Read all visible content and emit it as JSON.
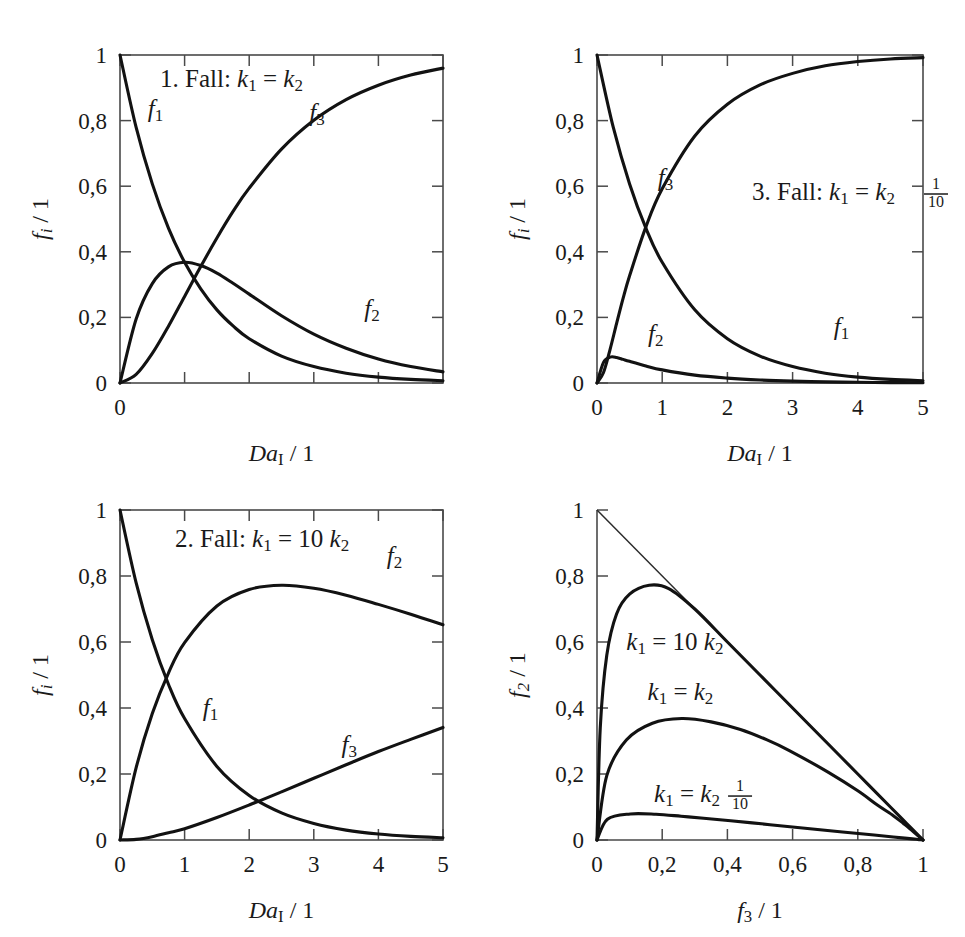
{
  "figure": {
    "background": "#ffffff",
    "curve_color": "#121212",
    "axis_color": "#4a4a4a",
    "panel_count": 4
  },
  "labels": {
    "f1": "f₁",
    "f2": "f₂",
    "f3": "f₃",
    "k1": "k₁",
    "k2": "k₂",
    "DaI_axis": "Daᴵ / 1",
    "fi_axis": "fᵢ / 1",
    "f2_axis": "f₂ / 1",
    "f3_axis": "f₃ / 1"
  },
  "chart_data": [
    {
      "id": "panel-1-fall-1",
      "type": "line",
      "title": "1. Fall: k₁ = k₂",
      "title_parts": {
        "prefix": "1. Fall: ",
        "lhs": "k",
        "lhs_sub": "1",
        "rel": "=",
        "coef": "",
        "rhs": "k",
        "rhs_sub": "2"
      },
      "xlabel": "Daᴵ / 1",
      "ylabel": "fᵢ / 1",
      "xlim": [
        0,
        5
      ],
      "ylim": [
        0,
        1
      ],
      "xticks": [
        0,
        1,
        2,
        3,
        4,
        5
      ],
      "xticklabels": [
        "0",
        "",
        "",
        "",
        "",
        ""
      ],
      "yticks": [
        0,
        0.2,
        0.4,
        0.6,
        0.8,
        1
      ],
      "yticklabels": [
        "0",
        "0,2",
        "0,4",
        "0,6",
        "0,8",
        "1"
      ],
      "grid": false,
      "frame": "box",
      "legend": "inline-curve-labels",
      "annotations": [
        {
          "text": "f₁",
          "x": 0.55,
          "y": 0.81
        },
        {
          "text": "f₃",
          "x": 3.05,
          "y": 0.8
        },
        {
          "text": "f₂",
          "x": 3.9,
          "y": 0.2
        }
      ],
      "series": [
        {
          "name": "f1",
          "formula": "exp(-Da)",
          "x": [
            0,
            0.25,
            0.5,
            0.75,
            1,
            1.25,
            1.5,
            1.75,
            2,
            2.5,
            3,
            3.5,
            4,
            4.5,
            5
          ],
          "values": [
            1,
            0.779,
            0.607,
            0.472,
            0.368,
            0.287,
            0.223,
            0.174,
            0.135,
            0.082,
            0.05,
            0.03,
            0.018,
            0.011,
            0.007
          ]
        },
        {
          "name": "f2",
          "formula": "Da*exp(-Da)",
          "x": [
            0,
            0.25,
            0.5,
            0.75,
            1,
            1.25,
            1.5,
            1.75,
            2,
            2.5,
            3,
            3.5,
            4,
            4.5,
            5
          ],
          "values": [
            0,
            0.195,
            0.303,
            0.354,
            0.368,
            0.358,
            0.335,
            0.304,
            0.271,
            0.205,
            0.149,
            0.106,
            0.073,
            0.05,
            0.034
          ]
        },
        {
          "name": "f3",
          "formula": "1-(1+Da)exp(-Da)",
          "x": [
            0,
            0.25,
            0.5,
            0.75,
            1,
            1.25,
            1.5,
            1.75,
            2,
            2.5,
            3,
            3.5,
            4,
            4.5,
            5
          ],
          "values": [
            0,
            0.026,
            0.09,
            0.173,
            0.264,
            0.355,
            0.442,
            0.523,
            0.594,
            0.713,
            0.801,
            0.864,
            0.908,
            0.939,
            0.96
          ]
        }
      ]
    },
    {
      "id": "panel-3-fall-3",
      "type": "line",
      "title": "3. Fall: k₁ = 1/10 k₂",
      "title_parts": {
        "prefix": "3. Fall: ",
        "lhs": "k",
        "lhs_sub": "1",
        "rel": "=",
        "coef_num": "1",
        "coef_den": "10",
        "rhs": "k",
        "rhs_sub": "2"
      },
      "xlabel": "Daᴵ / 1",
      "ylabel": "fᵢ / 1",
      "xlim": [
        0,
        5
      ],
      "ylim": [
        0,
        1
      ],
      "xticks": [
        0,
        1,
        2,
        3,
        4,
        5
      ],
      "xticklabels": [
        "0",
        "1",
        "2",
        "3",
        "4",
        "5"
      ],
      "yticks": [
        0,
        0.2,
        0.4,
        0.6,
        0.8,
        1
      ],
      "yticklabels": [
        "0",
        "0,2",
        "0,4",
        "0,6",
        "0,8",
        "1"
      ],
      "grid": false,
      "frame": "box",
      "legend": "inline-curve-labels",
      "annotations": [
        {
          "text": "f₃",
          "x": 1.05,
          "y": 0.6
        },
        {
          "text": "f₂",
          "x": 0.9,
          "y": 0.125
        },
        {
          "text": "f₁",
          "x": 3.75,
          "y": 0.145
        }
      ],
      "series": [
        {
          "name": "f1",
          "formula": "exp(-Da)",
          "x": [
            0,
            0.25,
            0.5,
            0.75,
            1,
            1.5,
            2,
            2.5,
            3,
            3.5,
            4,
            4.5,
            5
          ],
          "values": [
            1,
            0.779,
            0.607,
            0.472,
            0.368,
            0.223,
            0.135,
            0.082,
            0.05,
            0.03,
            0.018,
            0.011,
            0.007
          ]
        },
        {
          "name": "f2",
          "formula": "(k1/(k2-k1))*(exp(-k1 Da)-exp(-k2 Da)), k2=10k1",
          "x": [
            0,
            0.1,
            0.2,
            0.3,
            0.4,
            0.5,
            0.75,
            1,
            1.5,
            2,
            2.5,
            3,
            3.5,
            4,
            4.5,
            5
          ],
          "values": [
            0,
            0.063,
            0.079,
            0.078,
            0.072,
            0.066,
            0.052,
            0.04,
            0.024,
            0.015,
            0.0092,
            0.0056,
            0.0034,
            0.0021,
            0.0012,
            0.0008
          ]
        },
        {
          "name": "f3",
          "formula": "1-f1-f2",
          "x": [
            0,
            0.1,
            0.2,
            0.3,
            0.4,
            0.5,
            0.75,
            1,
            1.5,
            2,
            2.5,
            3,
            3.5,
            4,
            4.5,
            5
          ],
          "values": [
            0,
            0.032,
            0.102,
            0.181,
            0.258,
            0.327,
            0.476,
            0.592,
            0.753,
            0.85,
            0.909,
            0.944,
            0.967,
            0.98,
            0.988,
            0.992
          ]
        }
      ]
    },
    {
      "id": "panel-2-fall-2",
      "type": "line",
      "title": "2. Fall: k₁ = 10 k₂",
      "title_parts": {
        "prefix": "2. Fall: ",
        "lhs": "k",
        "lhs_sub": "1",
        "rel": "=",
        "coef": "10",
        "rhs": "k",
        "rhs_sub": "2"
      },
      "xlabel": "Daᴵ / 1",
      "ylabel": "fᵢ / 1",
      "xlim": [
        0,
        5
      ],
      "ylim": [
        0,
        1
      ],
      "xticks": [
        0,
        1,
        2,
        3,
        4,
        5
      ],
      "xticklabels": [
        "0",
        "1",
        "2",
        "3",
        "4",
        "5"
      ],
      "yticks": [
        0,
        0.2,
        0.4,
        0.6,
        0.8,
        1
      ],
      "yticklabels": [
        "0",
        "0,2",
        "0,4",
        "0,6",
        "0,8",
        "1"
      ],
      "grid": false,
      "frame": "box",
      "legend": "inline-curve-labels",
      "annotations": [
        {
          "text": "f₂",
          "x": 4.25,
          "y": 0.835
        },
        {
          "text": "f₁",
          "x": 1.4,
          "y": 0.375
        },
        {
          "text": "f₃",
          "x": 3.55,
          "y": 0.265
        }
      ],
      "series": [
        {
          "name": "f1",
          "formula": "exp(-Da)",
          "x": [
            0,
            0.25,
            0.5,
            0.75,
            1,
            1.5,
            2,
            2.5,
            3,
            3.5,
            4,
            4.5,
            5
          ],
          "values": [
            1,
            0.779,
            0.607,
            0.472,
            0.368,
            0.223,
            0.135,
            0.082,
            0.05,
            0.03,
            0.018,
            0.011,
            0.007
          ]
        },
        {
          "name": "f2",
          "formula": "(10/9)*(exp(-0.1 Da)-exp(-Da))",
          "x": [
            0,
            0.25,
            0.5,
            0.75,
            1,
            1.5,
            2,
            2.5,
            3,
            3.5,
            4,
            4.5,
            5
          ],
          "values": [
            0,
            0.219,
            0.383,
            0.506,
            0.598,
            0.709,
            0.759,
            0.772,
            0.763,
            0.742,
            0.714,
            0.684,
            0.652
          ]
        },
        {
          "name": "f3",
          "formula": "1-f1-f2",
          "x": [
            0,
            0.25,
            0.5,
            0.75,
            1,
            1.5,
            2,
            2.5,
            3,
            3.5,
            4,
            4.5,
            5
          ],
          "values": [
            0,
            0.002,
            0.01,
            0.022,
            0.034,
            0.068,
            0.106,
            0.146,
            0.187,
            0.228,
            0.268,
            0.305,
            0.341
          ]
        }
      ]
    },
    {
      "id": "panel-4-selectivity",
      "type": "line",
      "title": "",
      "xlabel": "f₃ / 1",
      "ylabel": "f₂ / 1",
      "xlim": [
        0,
        1
      ],
      "ylim": [
        0,
        1
      ],
      "xticks": [
        0,
        0.2,
        0.4,
        0.6,
        0.8,
        1
      ],
      "xticklabels": [
        "0",
        "0,2",
        "0,4",
        "0,6",
        "0,8",
        "1"
      ],
      "yticks": [
        0,
        0.2,
        0.4,
        0.6,
        0.8,
        1
      ],
      "yticklabels": [
        "0",
        "0,2",
        "0,4",
        "0,6",
        "0,8",
        "1"
      ],
      "grid": false,
      "frame": "axes-only",
      "legend": "inline-curve-labels",
      "annotations": [
        {
          "text": "k₁ = 10 k₂",
          "x": 0.09,
          "y": 0.575,
          "kind": "coef"
        },
        {
          "text": "k₁ = k₂",
          "x": 0.155,
          "y": 0.425,
          "kind": "plain"
        },
        {
          "text": "k₁ = 1/10 k₂",
          "x": 0.175,
          "y": 0.115,
          "kind": "frac"
        }
      ],
      "series": [
        {
          "name": "diagonal",
          "formula": "f2 = 1 - f3 (upper bound)",
          "thin": true,
          "x": [
            0,
            1
          ],
          "values": [
            1,
            0
          ]
        },
        {
          "name": "k1 = 10 k2",
          "formula": "max f2 ≈ 0,77 at f3 ≈ 0,16",
          "x": [
            0,
            0.01,
            0.03,
            0.06,
            0.1,
            0.16,
            0.22,
            0.3,
            0.4,
            0.5,
            0.6,
            0.7,
            0.8,
            0.9,
            0.95,
            1.0
          ],
          "values": [
            0,
            0.34,
            0.56,
            0.685,
            0.745,
            0.772,
            0.762,
            0.7,
            0.6,
            0.5,
            0.4,
            0.3,
            0.2,
            0.1,
            0.05,
            0
          ]
        },
        {
          "name": "k1 = k2",
          "formula": "max f2 ≈ 0,37 at f3 ≈ 0,26",
          "x": [
            0,
            0.03,
            0.09,
            0.17,
            0.26,
            0.35,
            0.44,
            0.52,
            0.59,
            0.71,
            0.8,
            0.86,
            0.91,
            0.94,
            0.96,
            1.0
          ],
          "values": [
            0,
            0.195,
            0.303,
            0.354,
            0.368,
            0.358,
            0.335,
            0.304,
            0.271,
            0.205,
            0.149,
            0.106,
            0.073,
            0.05,
            0.034,
            0
          ]
        },
        {
          "name": "k1 = 1/10 k2",
          "formula": "max f2 ≈ 0,08 at f3 ≈ 0,12",
          "x": [
            0,
            0.032,
            0.102,
            0.181,
            0.258,
            0.327,
            0.476,
            0.592,
            0.753,
            0.85,
            0.909,
            0.944,
            0.967,
            0.98,
            0.988,
            1.0
          ],
          "values": [
            0,
            0.063,
            0.079,
            0.078,
            0.072,
            0.066,
            0.052,
            0.04,
            0.024,
            0.015,
            0.0092,
            0.0056,
            0.0034,
            0.0021,
            0.0012,
            0
          ]
        }
      ]
    }
  ]
}
